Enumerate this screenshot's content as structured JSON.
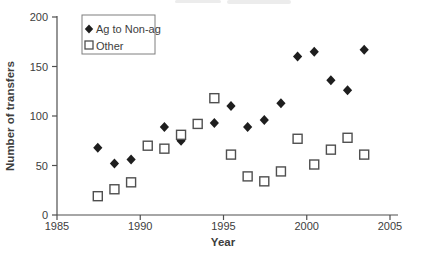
{
  "figure": {
    "background": "#ffffff"
  },
  "colors": {
    "axis": "#4f4f4f",
    "text": "#3d3d3d",
    "legend_border": "#7e7e7e",
    "diamond_fill": "#1e1e1e",
    "square_stroke": "#4f4f4f",
    "square_fill": "#ffffff"
  },
  "chart_data": {
    "type": "scatter",
    "title": "",
    "xlabel": "Year",
    "ylabel": "Number of transfers",
    "xlim": [
      1985,
      2005
    ],
    "ylim": [
      0,
      200
    ],
    "x_ticks": [
      1985,
      1990,
      1995,
      2000,
      2005
    ],
    "y_ticks": [
      0,
      50,
      100,
      150,
      200
    ],
    "grid": false,
    "legend_position": "top-left-inside",
    "marker_offset_years": 0.45,
    "series": [
      {
        "name": "Ag to Non-ag",
        "marker": "filled-diamond",
        "points": [
          [
            1987,
            68
          ],
          [
            1988,
            52
          ],
          [
            1989,
            56
          ],
          [
            1991,
            89
          ],
          [
            1992,
            75
          ],
          [
            1994,
            93
          ],
          [
            1995,
            110
          ],
          [
            1996,
            89
          ],
          [
            1997,
            96
          ],
          [
            1998,
            113
          ],
          [
            1999,
            160
          ],
          [
            2000,
            165
          ],
          [
            2001,
            136
          ],
          [
            2002,
            126
          ],
          [
            2003,
            167
          ]
        ]
      },
      {
        "name": "Other",
        "marker": "open-square",
        "points": [
          [
            1987,
            19
          ],
          [
            1988,
            26
          ],
          [
            1989,
            33
          ],
          [
            1990,
            70
          ],
          [
            1991,
            67
          ],
          [
            1992,
            81
          ],
          [
            1993,
            92
          ],
          [
            1994,
            118
          ],
          [
            1995,
            61
          ],
          [
            1996,
            39
          ],
          [
            1997,
            34
          ],
          [
            1998,
            44
          ],
          [
            1999,
            77
          ],
          [
            2000,
            51
          ],
          [
            2001,
            66
          ],
          [
            2002,
            78
          ],
          [
            2003,
            61
          ]
        ]
      }
    ]
  }
}
